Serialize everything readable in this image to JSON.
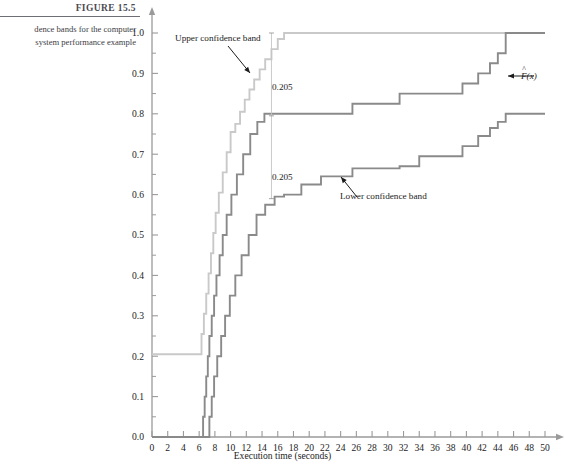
{
  "figure": {
    "number": "FIGURE 15.5",
    "caption_line1": "dence bands for the computer",
    "caption_line2": "system performance example"
  },
  "annotations": {
    "upper_band": "Upper confidence band",
    "lower_band": "Lower confidence band",
    "gap_top": "0.205",
    "gap_bottom": "0.205",
    "fhat": "F(x)"
  },
  "colors": {
    "upper_band": "#c9c9c9",
    "ecdf": "#8a8a8a",
    "lower_band": "#8a8a8a",
    "axis": "#9a9a9a",
    "text": "#1c1c1c"
  },
  "chart_data": {
    "type": "line",
    "title": "",
    "xlabel": "Execution time (seconds)",
    "ylabel": "",
    "xlim": [
      0,
      50
    ],
    "ylim": [
      0,
      1.0
    ],
    "xticks": [
      0,
      2,
      4,
      6,
      8,
      10,
      12,
      14,
      16,
      18,
      20,
      22,
      24,
      26,
      28,
      30,
      32,
      34,
      36,
      38,
      40,
      42,
      44,
      46,
      48,
      50
    ],
    "xtick_labels": [
      "0",
      "2",
      "4",
      "6",
      "8",
      "10",
      "12",
      "14",
      "16",
      "18",
      "20",
      "22",
      "24",
      "26",
      "28",
      "30",
      "32",
      "34",
      "36",
      "38",
      "40",
      "42",
      "44",
      "46",
      "48",
      "50"
    ],
    "yticks": [
      0.0,
      0.1,
      0.2,
      0.3,
      0.4,
      0.5,
      0.6,
      0.7,
      0.8,
      0.9,
      1.0
    ],
    "ytick_labels": [
      "0.0",
      "0.1",
      "0.2",
      "0.3",
      "0.4",
      "0.5",
      "0.6",
      "0.7",
      "0.8",
      "0.9",
      "1.0"
    ],
    "y_minor_step": 0.05,
    "grid": false,
    "legend": "none",
    "band_halfwidth": 0.205,
    "step_interpolation": "post",
    "series": [
      {
        "name": "Upper confidence band",
        "color": "#c9c9c9",
        "x": [
          0,
          6.0,
          6.3,
          6.6,
          6.9,
          7.2,
          7.5,
          7.8,
          8.1,
          8.5,
          9.0,
          9.5,
          10.0,
          10.6,
          11.2,
          11.8,
          12.4,
          13.0,
          13.7,
          14.4,
          15.2,
          16.0,
          16.8,
          50
        ],
        "y": [
          0.205,
          0.205,
          0.255,
          0.305,
          0.355,
          0.405,
          0.455,
          0.505,
          0.555,
          0.605,
          0.655,
          0.705,
          0.755,
          0.775,
          0.805,
          0.835,
          0.86,
          0.885,
          0.91,
          0.935,
          0.96,
          0.985,
          1.0,
          1.0
        ]
      },
      {
        "name": "F(x)",
        "color": "#8a8a8a",
        "x": [
          0,
          6.3,
          6.5,
          6.7,
          6.9,
          7.1,
          7.3,
          7.6,
          7.9,
          8.2,
          8.6,
          9.0,
          9.5,
          10.1,
          10.8,
          11.6,
          12.5,
          13.4,
          14.3,
          15.2,
          16.2,
          17.2,
          21.5,
          25.5,
          31.5,
          34.0,
          39.5,
          41.5,
          43.0,
          44.0,
          45.0,
          50
        ],
        "y": [
          0.0,
          0.0,
          0.05,
          0.1,
          0.15,
          0.2,
          0.25,
          0.3,
          0.35,
          0.4,
          0.45,
          0.5,
          0.55,
          0.6,
          0.65,
          0.7,
          0.75,
          0.78,
          0.8,
          0.8,
          0.8,
          0.8,
          0.8,
          0.825,
          0.85,
          0.85,
          0.875,
          0.9,
          0.925,
          0.95,
          1.0,
          1.0
        ]
      },
      {
        "name": "Lower confidence band",
        "color": "#8a8a8a",
        "x": [
          0,
          7.0,
          7.3,
          7.6,
          7.9,
          8.3,
          8.8,
          9.3,
          9.9,
          10.6,
          11.4,
          12.3,
          13.3,
          14.4,
          15.6,
          16.8,
          18.0,
          19.0,
          21.5,
          25.5,
          31.5,
          34.0,
          39.5,
          41.5,
          43.0,
          44.0,
          45.0,
          50
        ],
        "y": [
          0.0,
          0.0,
          0.05,
          0.1,
          0.15,
          0.2,
          0.25,
          0.3,
          0.35,
          0.4,
          0.45,
          0.5,
          0.55,
          0.575,
          0.595,
          0.6,
          0.6,
          0.625,
          0.645,
          0.665,
          0.67,
          0.695,
          0.72,
          0.745,
          0.765,
          0.78,
          0.8,
          0.8
        ]
      }
    ],
    "gap_marker": {
      "x": 15.2,
      "upper_y": 1.0,
      "mid_y": 0.795,
      "lower_y": 0.59
    }
  }
}
